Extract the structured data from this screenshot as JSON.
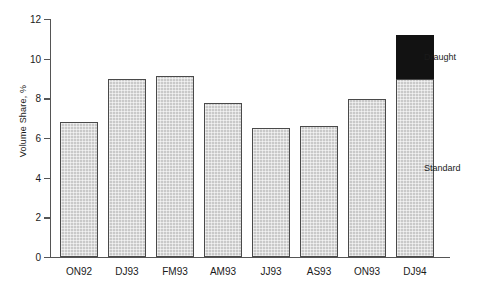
{
  "chart_data": {
    "type": "bar",
    "title": "",
    "subtitle": "",
    "xlabel": "",
    "ylabel": "Volume Share, %",
    "ylim": [
      0,
      12
    ],
    "yticks": [
      0,
      2,
      4,
      6,
      8,
      10,
      12
    ],
    "ytick_labels": [
      "0",
      "2",
      "4",
      "6",
      "8",
      "10",
      "12"
    ],
    "grid": false,
    "stacked": true,
    "legend_position": "inline-right",
    "categories": [
      "ON92",
      "DJ93",
      "FM93",
      "AM93",
      "JJ93",
      "AS93",
      "ON93",
      "DJ94"
    ],
    "series": [
      {
        "name": "Standard",
        "color": "#c9c9c9",
        "values": [
          6.8,
          9.0,
          9.15,
          7.75,
          6.5,
          6.6,
          7.95,
          9.0
        ]
      },
      {
        "name": "Draught",
        "color": "#121212",
        "values": [
          0,
          0,
          0,
          0,
          0,
          0,
          0,
          2.2
        ]
      }
    ],
    "annotations": [
      {
        "text": "Draught",
        "value": 10.1
      },
      {
        "text": "Standard",
        "value": 4.5
      }
    ]
  }
}
